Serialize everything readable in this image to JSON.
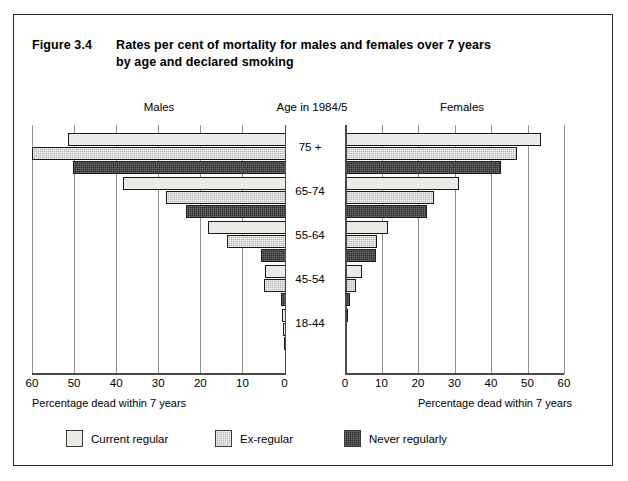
{
  "figure": {
    "number": "Figure 3.4",
    "title_line1": "Rates per cent of mortality for males and females over 7 years",
    "title_line2": "by age and declared smoking"
  },
  "panels": {
    "left_header": "Males",
    "center_header": "Age in 1984/5",
    "right_header": "Females"
  },
  "axis": {
    "title_left": "Percentage dead within 7 years",
    "title_right": "Percentage dead within 7 years",
    "left_ticks": [
      "60",
      "50",
      "40",
      "30",
      "20",
      "10",
      "0"
    ],
    "right_ticks": [
      "0",
      "10",
      "20",
      "30",
      "40",
      "50",
      "60"
    ]
  },
  "age_labels": [
    "75 +",
    "65-74",
    "55-64",
    "45-54",
    "18-44"
  ],
  "legend": [
    {
      "label": "Current regular",
      "color": "#eceae7",
      "key": "current_regular"
    },
    {
      "label": "Ex-regular",
      "color": "#b9b9b6",
      "key": "ex_regular"
    },
    {
      "label": "Never regularly",
      "color": "#2e2c2b",
      "key": "never_regularly"
    }
  ],
  "colors": {
    "current_regular": "#eceae7",
    "ex_regular": "#b9b9b6",
    "never_regularly": "#2e2c2b",
    "frame": "#2b2b2b",
    "axis": "#4a4a4a",
    "gridtick": "#8f8f8f"
  },
  "chart_data": {
    "type": "bar",
    "orientation": "horizontal",
    "layout": "population-pyramid (back-to-back)",
    "title": "Rates per cent of mortality for males and females over 7 years by age and declared smoking",
    "xlabel": "Percentage dead within 7 years",
    "ylabel": "Age in 1984/5",
    "xlim": [
      0,
      60
    ],
    "xticks": [
      0,
      10,
      20,
      30,
      40,
      50,
      60
    ],
    "grid": true,
    "legend_position": "bottom-left",
    "categories": [
      "75 +",
      "65-74",
      "55-64",
      "45-54",
      "18-44"
    ],
    "panels": [
      {
        "name": "Males",
        "direction": "left",
        "series": [
          {
            "name": "Current regular",
            "values": [
              51.7,
              38.8,
              18.6,
              4.9,
              0.9
            ]
          },
          {
            "name": "Ex-regular",
            "values": [
              60.3,
              28.4,
              14.0,
              5.2,
              0.8
            ]
          },
          {
            "name": "Never regularly",
            "values": [
              50.5,
              23.7,
              6.0,
              1.1,
              0.4
            ]
          }
        ]
      },
      {
        "name": "Females",
        "direction": "right",
        "series": [
          {
            "name": "Current regular",
            "values": [
              53.8,
              31.3,
              11.8,
              4.7,
              0.7
            ]
          },
          {
            "name": "Ex-regular",
            "values": [
              47.2,
              24.4,
              8.8,
              3.1,
              0.5
            ]
          },
          {
            "name": "Never regularly",
            "values": [
              42.8,
              22.6,
              8.6,
              1.5,
              0.3
            ]
          }
        ]
      }
    ]
  }
}
